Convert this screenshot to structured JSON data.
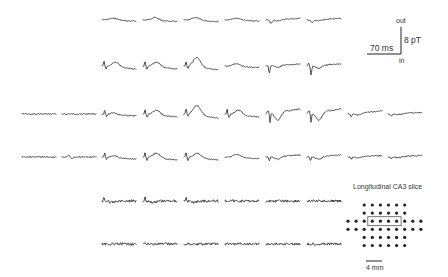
{
  "figure": {
    "type": "MEG sensor-array trace map",
    "panel_title": "Longitudinal CA3 slice",
    "scale_bar": {
      "time_label": "70 ms",
      "amplitude_label": "8 pT",
      "polarity_top": "out",
      "polarity_bottom": "in"
    },
    "array_scale_label": "4 mm",
    "trace_color": "#3a3a3a",
    "trace_grid": {
      "column_x": [
        22,
        62,
        102,
        143,
        184,
        225,
        266,
        307,
        348,
        388
      ],
      "trace_width": 34,
      "rows": [
        {
          "y": 20,
          "columns": [
            2,
            3,
            4,
            5,
            6,
            7
          ],
          "shapes": [
            "flat_bump",
            "small_bump",
            "small_bump",
            "flat_bump",
            "dip",
            "dip"
          ]
        },
        {
          "y": 66,
          "columns": [
            2,
            3,
            4,
            5,
            6,
            7
          ],
          "shapes": [
            "spike_bump",
            "spike_bump",
            "spike_big_bump",
            "small_bump",
            "sharp_dip",
            "sharp_dip_deep"
          ]
        },
        {
          "y": 114,
          "columns": [
            0,
            1,
            2,
            3,
            4,
            5,
            6,
            7,
            8,
            9
          ],
          "shapes": [
            "flat",
            "flat",
            "spike_small",
            "spike_bump",
            "spike_big_bump",
            "spike_bump",
            "v_dip",
            "v_dip",
            "dip_small",
            "flat_dip"
          ]
        },
        {
          "y": 157,
          "columns": [
            0,
            1,
            2,
            3,
            4,
            5,
            6,
            7,
            8,
            9
          ],
          "shapes": [
            "flat",
            "small_wiggle",
            "spike_small",
            "spike_bump",
            "spike_bump",
            "small_bump",
            "small_dip",
            "small_dip",
            "flat_dip",
            "flat_dip"
          ]
        },
        {
          "y": 201,
          "columns": [
            2,
            3,
            4,
            5,
            6,
            7
          ],
          "shapes": [
            "noisy_spike",
            "noisy_spike",
            "noisy_spike",
            "noisy",
            "noisy",
            "noisy"
          ]
        },
        {
          "y": 244,
          "columns": [
            2,
            3,
            4,
            5,
            6,
            7
          ],
          "shapes": [
            "noisy",
            "noisy",
            "noisy",
            "noisy",
            "noisy",
            "noisy"
          ]
        }
      ]
    },
    "sensor_array": {
      "dot_pitch": 8.1,
      "origin_x": 348,
      "origin_y": 205,
      "rows": [
        {
          "start_col": 2,
          "count": 6
        },
        {
          "start_col": 2,
          "count": 6
        },
        {
          "start_col": 0,
          "count": 10
        },
        {
          "start_col": 0,
          "count": 10
        },
        {
          "start_col": 2,
          "count": 6
        },
        {
          "start_col": 2,
          "count": 6
        }
      ],
      "roi_box": {
        "row": 2,
        "start_col": 3,
        "count": 4
      }
    }
  }
}
